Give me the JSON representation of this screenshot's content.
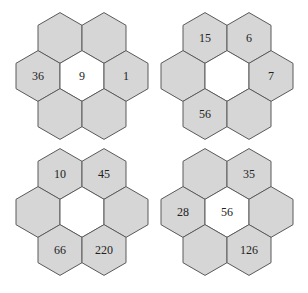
{
  "colors": {
    "petal_fill": "#d6d6d6",
    "center_fill": "#ffffff",
    "stroke": "#5a5a5a",
    "text": "#222222"
  },
  "flowers": [
    {
      "id": "top-left",
      "center": "9",
      "petals": {
        "top_left": "",
        "top_right": "",
        "left": "36",
        "right": "1",
        "bottom_left": "",
        "bottom_right": ""
      }
    },
    {
      "id": "top-right",
      "center": "",
      "petals": {
        "top_left": "15",
        "top_right": "6",
        "left": "",
        "right": "7",
        "bottom_left": "56",
        "bottom_right": ""
      }
    },
    {
      "id": "bottom-left",
      "center": "",
      "petals": {
        "top_left": "10",
        "top_right": "45",
        "left": "",
        "right": "",
        "bottom_left": "66",
        "bottom_right": "220"
      }
    },
    {
      "id": "bottom-right",
      "center": "56",
      "petals": {
        "top_left": "",
        "top_right": "35",
        "left": "28",
        "right": "",
        "bottom_left": "",
        "bottom_right": "126"
      }
    }
  ]
}
